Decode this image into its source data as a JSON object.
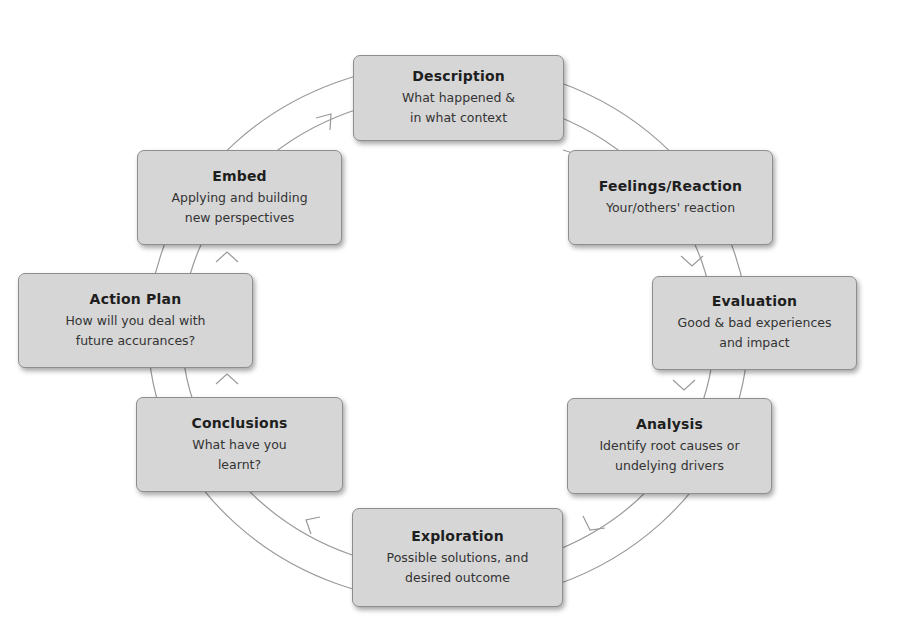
{
  "diagram": {
    "type": "reflective-cycle",
    "colors": {
      "box_fill": "#d6d6d6",
      "box_border": "#8e8e8e",
      "ring_fill": "#ffffff",
      "ring_stroke": "#9a9a9a",
      "text": "#2a2a2a"
    },
    "stages": [
      {
        "id": "description",
        "title": "Description",
        "lines": [
          "What happened &",
          "in what context"
        ]
      },
      {
        "id": "feelings",
        "title": "Feelings/Reaction",
        "lines": [
          "Your/others' reaction"
        ]
      },
      {
        "id": "evaluation",
        "title": "Evaluation",
        "lines": [
          "Good & bad experiences",
          "and impact"
        ]
      },
      {
        "id": "analysis",
        "title": "Analysis",
        "lines": [
          "Identify root causes or",
          "undelying drivers"
        ]
      },
      {
        "id": "exploration",
        "title": "Exploration",
        "lines": [
          "Possible solutions, and",
          "desired outcome"
        ]
      },
      {
        "id": "conclusions",
        "title": "Conclusions",
        "lines": [
          "What have you",
          "learnt?"
        ]
      },
      {
        "id": "action-plan",
        "title": "Action Plan",
        "lines": [
          "How will you deal with",
          "future accurances?"
        ]
      },
      {
        "id": "embed",
        "title": "Embed",
        "lines": [
          "Applying and building",
          "new perspectives"
        ]
      }
    ],
    "flow_direction": "clockwise"
  }
}
